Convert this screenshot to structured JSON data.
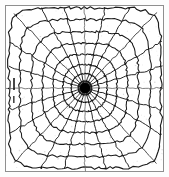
{
  "figure": {
    "kind": "radial-grid-diagram"
  },
  "canvas": {
    "width": 169,
    "height": 177,
    "background_color": "#fdfdfd"
  },
  "frame": {
    "name": "outer-square-frame",
    "x": 5.5,
    "y": 5.5,
    "width": 158,
    "height": 166,
    "stroke_color": "#8f8f8f",
    "stroke_width": 1
  },
  "center": {
    "name": "convergence-point",
    "x": 85,
    "y": 88,
    "blob_radius": 5.2,
    "halo_radius": 7.4,
    "color": "#000000"
  },
  "geometry": {
    "half_width": 78,
    "half_height": 82,
    "spoke_count": 24,
    "spoke_step_degrees": 15,
    "ring_count": 8,
    "ring_fractions": [
      0.085,
      0.175,
      0.285,
      0.41,
      0.545,
      0.685,
      0.835,
      0.975
    ],
    "ring_squareness": [
      2.0,
      2.1,
      2.35,
      2.7,
      3.2,
      3.9,
      5.0,
      7.0
    ],
    "line_color": "#1b1b1b",
    "line_width": 1.05
  },
  "axes": {
    "horizontal_ray_color": "#6a6a6a",
    "vertical_ray_color": "#6a6a6a",
    "diagonal_ray_color": "#3a3a3a"
  }
}
